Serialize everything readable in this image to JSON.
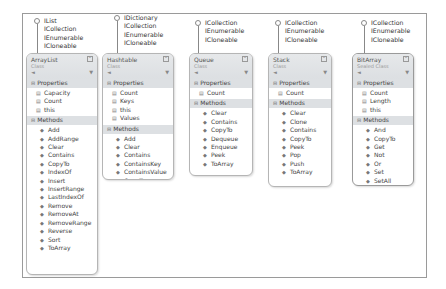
{
  "diagram": {
    "classes": [
      {
        "name": "ArrayList",
        "kind": "Class",
        "interfaces": [
          "IList",
          "ICollection",
          "IEnumerable",
          "ICloneable"
        ],
        "properties_label": "Properties",
        "properties": [
          "Capacity",
          "Count",
          "this"
        ],
        "methods_label": "Methods",
        "methods": [
          "Add",
          "AddRange",
          "Clear",
          "Contains",
          "CopyTo",
          "IndexOf",
          "Insert",
          "InsertRange",
          "LastIndexOf",
          "Remove",
          "RemoveAt",
          "RemoveRange",
          "Reverse",
          "Sort",
          "ToArray"
        ]
      },
      {
        "name": "Hashtable",
        "kind": "Class",
        "interfaces": [
          "IDictionary",
          "ICollection",
          "IEnumerable",
          "ICloneable"
        ],
        "properties_label": "Properties",
        "properties": [
          "Count",
          "Keys",
          "this",
          "Values"
        ],
        "methods_label": "Methods",
        "methods": [
          "Add",
          "Clear",
          "Contains",
          "ContainsKey",
          "ContainsValue",
          "CopyTo",
          "Remove"
        ]
      },
      {
        "name": "Queue",
        "kind": "Class",
        "interfaces": [
          "ICollection",
          "IEnumerable",
          "ICloneable"
        ],
        "properties_label": "Properties",
        "properties": [
          "Count"
        ],
        "methods_label": "Methods",
        "methods": [
          "Clear",
          "Contains",
          "CopyTo",
          "Dequeue",
          "Enqueue",
          "Peek",
          "ToArray"
        ]
      },
      {
        "name": "Stack",
        "kind": "Class",
        "interfaces": [
          "ICollection",
          "IEnumerable",
          "ICloneable"
        ],
        "properties_label": "Properties",
        "properties": [
          "Count"
        ],
        "methods_label": "Methods",
        "methods": [
          "Clear",
          "Clone",
          "Contains",
          "CopyTo",
          "Peek",
          "Pop",
          "Push",
          "ToArray"
        ]
      },
      {
        "name": "BitArray",
        "kind": "Sealed Class",
        "interfaces": [
          "ICollection",
          "IEnumerable",
          "ICloneable"
        ],
        "properties_label": "Properties",
        "properties": [
          "Count",
          "Length",
          "this"
        ],
        "methods_label": "Methods",
        "methods": [
          "And",
          "CopyTo",
          "Get",
          "Not",
          "Or",
          "Set",
          "SetAll",
          "Xor"
        ]
      }
    ],
    "icons": {
      "lollipop": "interface-lollipop-icon",
      "property": "property-icon",
      "method": "method-icon",
      "collapse": "collapse-icon",
      "filter": "filter-icon",
      "section_toggle": "minus-box-icon"
    }
  }
}
